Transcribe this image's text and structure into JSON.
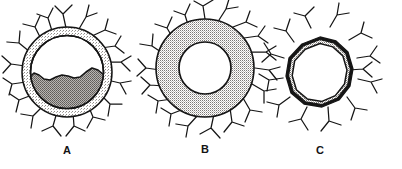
{
  "figure": {
    "caption_labels": [
      "A",
      "B",
      "C"
    ],
    "background_color": "#ffffff",
    "ink_color": "#151515",
    "width": 402,
    "height": 169
  },
  "panels": [
    {
      "id": "A",
      "label": "A",
      "label_x": 52,
      "label_y": 144,
      "center_x": 67,
      "center_y": 72,
      "outer_radius": 46,
      "shell_outer_radius": 45,
      "shell_inner_radius": 38,
      "shell_fill": "#d8d6d4",
      "shell_pattern": "light-stipple",
      "core_fill": "#9a9795",
      "core_pattern": "dense-stipple",
      "core_description": "lower portion filled with dense stipple, wavy horizontal fluid-level boundary across the middle",
      "fluid_level_y": 77,
      "interior_top_fill": "#ffffff",
      "spicule_count": 16,
      "spicule_type": "branched-y-shaped",
      "spicules_attached": true
    },
    {
      "id": "B",
      "label": "B",
      "label_x": 190,
      "label_y": 143,
      "center_x": 205,
      "center_y": 68,
      "outer_radius": 50,
      "shell_outer_radius": 49,
      "shell_inner_radius": 26,
      "shell_fill": "#dededc",
      "shell_pattern": "uniform-stipple",
      "core_fill": "#ffffff",
      "core_pattern": "none",
      "core_description": "clear white circular center, thick stippled annulus",
      "spicule_count": 17,
      "spicule_type": "branched-y-shaped",
      "spicules_attached": true
    },
    {
      "id": "C",
      "label": "C",
      "label_x": 305,
      "label_y": 144,
      "center_x": 320,
      "center_y": 73,
      "outer_radius": 36,
      "shell_outer_radius": 33,
      "shell_inner_radius": 28,
      "shell_fill": "#c9c7c5",
      "shell_pattern": "thin-stipple-band",
      "core_fill": "#ffffff",
      "core_pattern": "none",
      "core_description": "thin irregular polygonal double-line ring, narrow stippled band, white center",
      "spicule_count": 13,
      "spicule_type": "branched-y-shaped",
      "spicules_attached": false
    }
  ]
}
